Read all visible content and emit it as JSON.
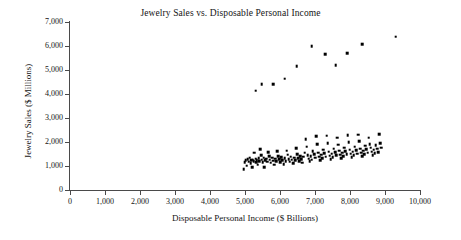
{
  "chart_data": {
    "type": "scatter",
    "title": "Jewelry Sales vs. Disposable Personal Income",
    "xlabel": "Disposable Personal Income ($ Billions)",
    "ylabel": "Jewelry Sales ($ Millions)",
    "xlim": [
      0,
      10000
    ],
    "ylim": [
      0,
      7000
    ],
    "xticks": [
      "0",
      "1,000",
      "2,000",
      "3,000",
      "4,000",
      "5,000",
      "6,000",
      "7,000",
      "8,000",
      "9,000",
      "10,000"
    ],
    "xtick_values": [
      0,
      1000,
      2000,
      3000,
      4000,
      5000,
      6000,
      7000,
      8000,
      9000,
      10000
    ],
    "yticks": [
      "0",
      "1,000",
      "2,000",
      "3,000",
      "4,000",
      "5,000",
      "6,000",
      "7,000"
    ],
    "ytick_values": [
      0,
      1000,
      2000,
      3000,
      4000,
      5000,
      6000,
      7000
    ],
    "grid": false,
    "legend": false,
    "marker": "square",
    "marker_color": "#000000",
    "series": [
      {
        "name": "Upper band (holiday/annual peak months)",
        "points": [
          [
            5310,
            4140
          ],
          [
            5480,
            4400
          ],
          [
            5800,
            4420
          ],
          [
            6130,
            4630
          ],
          [
            6480,
            5170
          ],
          [
            6900,
            5990
          ],
          [
            7290,
            5660
          ],
          [
            7590,
            5210
          ],
          [
            7920,
            5700
          ],
          [
            8350,
            6080
          ],
          [
            9300,
            6380
          ]
        ]
      },
      {
        "name": "Lower band (regular months)",
        "points": [
          [
            4960,
            860
          ],
          [
            4990,
            1160
          ],
          [
            5020,
            1230
          ],
          [
            5050,
            1020
          ],
          [
            5080,
            1290
          ],
          [
            5110,
            1180
          ],
          [
            5130,
            1340
          ],
          [
            5160,
            1110
          ],
          [
            5180,
            1230
          ],
          [
            5200,
            940
          ],
          [
            5220,
            1270
          ],
          [
            5250,
            1200
          ],
          [
            5270,
            1560
          ],
          [
            5300,
            1300
          ],
          [
            5320,
            1160
          ],
          [
            5340,
            1250
          ],
          [
            5360,
            1050
          ],
          [
            5390,
            1330
          ],
          [
            5410,
            1210
          ],
          [
            5430,
            1700
          ],
          [
            5460,
            1450
          ],
          [
            5480,
            1270
          ],
          [
            5500,
            1160
          ],
          [
            5530,
            1350
          ],
          [
            5550,
            940
          ],
          [
            5580,
            1240
          ],
          [
            5610,
            1310
          ],
          [
            5640,
            1180
          ],
          [
            5660,
            1580
          ],
          [
            5690,
            1420
          ],
          [
            5710,
            1260
          ],
          [
            5740,
            1140
          ],
          [
            5770,
            1340
          ],
          [
            5800,
            1220
          ],
          [
            5830,
            1050
          ],
          [
            5860,
            1300
          ],
          [
            5890,
            1190
          ],
          [
            5920,
            1620
          ],
          [
            5950,
            1400
          ],
          [
            5980,
            1280
          ],
          [
            6010,
            1150
          ],
          [
            6040,
            1360
          ],
          [
            6070,
            1240
          ],
          [
            6100,
            1080
          ],
          [
            6130,
            1320
          ],
          [
            6160,
            1200
          ],
          [
            6190,
            1640
          ],
          [
            6220,
            1470
          ],
          [
            6250,
            1290
          ],
          [
            6280,
            1180
          ],
          [
            6310,
            1390
          ],
          [
            6340,
            1260
          ],
          [
            6370,
            1110
          ],
          [
            6400,
            1350
          ],
          [
            6430,
            1230
          ],
          [
            6460,
            1740
          ],
          [
            6490,
            1500
          ],
          [
            6520,
            1320
          ],
          [
            6550,
            1210
          ],
          [
            6580,
            1420
          ],
          [
            6610,
            1280
          ],
          [
            6640,
            1140
          ],
          [
            6670,
            1380
          ],
          [
            6700,
            1550
          ],
          [
            6730,
            2120
          ],
          [
            6760,
            1800
          ],
          [
            6790,
            1460
          ],
          [
            6820,
            1300
          ],
          [
            6850,
            1190
          ],
          [
            6880,
            1410
          ],
          [
            6910,
            1270
          ],
          [
            6940,
            1620
          ],
          [
            6970,
            1480
          ],
          [
            7000,
            1340
          ],
          [
            7030,
            2230
          ],
          [
            7060,
            1910
          ],
          [
            7090,
            1560
          ],
          [
            7120,
            1380
          ],
          [
            7150,
            1240
          ],
          [
            7180,
            1470
          ],
          [
            7210,
            1330
          ],
          [
            7240,
            1680
          ],
          [
            7270,
            1530
          ],
          [
            7300,
            1390
          ],
          [
            7330,
            2260
          ],
          [
            7360,
            1950
          ],
          [
            7390,
            1600
          ],
          [
            7420,
            1430
          ],
          [
            7450,
            1290
          ],
          [
            7480,
            1520
          ],
          [
            7510,
            1370
          ],
          [
            7540,
            1720
          ],
          [
            7570,
            1580
          ],
          [
            7600,
            1440
          ],
          [
            7630,
            2180
          ],
          [
            7660,
            1880
          ],
          [
            7690,
            1640
          ],
          [
            7720,
            1470
          ],
          [
            7750,
            1330
          ],
          [
            7780,
            1560
          ],
          [
            7810,
            1410
          ],
          [
            7840,
            1760
          ],
          [
            7870,
            1620
          ],
          [
            7900,
            1480
          ],
          [
            7930,
            2290
          ],
          [
            7960,
            1980
          ],
          [
            7990,
            1680
          ],
          [
            8020,
            1510
          ],
          [
            8050,
            1360
          ],
          [
            8080,
            1600
          ],
          [
            8110,
            1450
          ],
          [
            8140,
            1800
          ],
          [
            8170,
            1660
          ],
          [
            8200,
            1520
          ],
          [
            8230,
            2310
          ],
          [
            8260,
            2030
          ],
          [
            8290,
            1720
          ],
          [
            8320,
            1550
          ],
          [
            8350,
            1400
          ],
          [
            8380,
            1640
          ],
          [
            8410,
            1490
          ],
          [
            8440,
            1840
          ],
          [
            8470,
            1700
          ],
          [
            8500,
            1560
          ],
          [
            8530,
            2180
          ],
          [
            8560,
            1900
          ],
          [
            8590,
            1760
          ],
          [
            8620,
            1590
          ],
          [
            8650,
            1440
          ],
          [
            8680,
            1680
          ],
          [
            8710,
            1530
          ],
          [
            8740,
            1860
          ],
          [
            8770,
            1720
          ],
          [
            8800,
            1580
          ],
          [
            8830,
            2330
          ],
          [
            8860,
            1950
          ],
          [
            8890,
            1760
          ]
        ]
      }
    ]
  }
}
